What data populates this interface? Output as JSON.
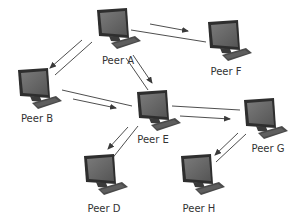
{
  "diagram": {
    "type": "peer-to-peer network",
    "colors": {
      "background": "#ffffff",
      "arrow": "#3a3a3a",
      "label": "#333333",
      "monitor_frame": "#2e2e2e",
      "monitor_screen": "#6a6a6a",
      "keyboard": "#4a4a4a"
    },
    "nodes": [
      {
        "id": "A",
        "label": "Peer A",
        "icon": "computer-icon",
        "x": 117,
        "y": 30
      },
      {
        "id": "B",
        "label": "Peer B",
        "icon": "computer-icon",
        "x": 38,
        "y": 90
      },
      {
        "id": "E",
        "label": "Peer E",
        "icon": "computer-icon",
        "x": 157,
        "y": 112
      },
      {
        "id": "F",
        "label": "Peer F",
        "icon": "computer-icon",
        "x": 228,
        "y": 42
      },
      {
        "id": "G",
        "label": "Peer G",
        "icon": "computer-icon",
        "x": 264,
        "y": 120
      },
      {
        "id": "D",
        "label": "Peer D",
        "icon": "computer-icon",
        "x": 104,
        "y": 176
      },
      {
        "id": "H",
        "label": "Peer H",
        "icon": "computer-icon",
        "x": 201,
        "y": 176
      }
    ],
    "edges": [
      {
        "from": "A",
        "to": "B",
        "arrow": "towards B"
      },
      {
        "from": "A",
        "to": "F",
        "arrow": "towards F"
      },
      {
        "from": "A",
        "to": "E",
        "arrow": "towards E"
      },
      {
        "from": "B",
        "to": "E",
        "arrow": "towards E"
      },
      {
        "from": "E",
        "to": "G",
        "arrow": "towards G"
      },
      {
        "from": "E",
        "to": "D",
        "arrow": "towards D"
      },
      {
        "from": "G",
        "to": "H",
        "arrow": "towards H"
      }
    ]
  }
}
